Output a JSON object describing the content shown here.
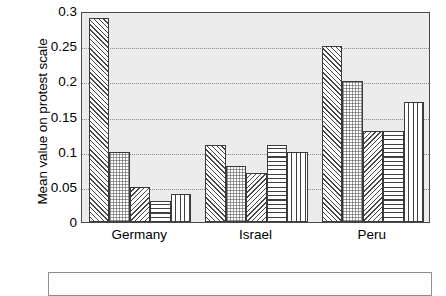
{
  "chart_data": {
    "type": "bar",
    "title": "",
    "xlabel": "",
    "ylabel": "Mean value on protest scale",
    "categories": [
      "Germany",
      "Israel",
      "Peru"
    ],
    "ylim": [
      0,
      0.3
    ],
    "yticks": [
      0,
      0.05,
      0.1,
      0.15,
      0.2,
      0.25,
      0.3
    ],
    "ytick_labels": [
      "0",
      "0.05",
      "0.1",
      "0.15",
      "0.2",
      "0.25",
      "0.3"
    ],
    "grid": true,
    "legend_position": "below-plot",
    "legend_entries": [],
    "series": [
      {
        "name": "series-1",
        "pattern": "diagonal-forward-hatch",
        "values": [
          0.29,
          0.11,
          0.25
        ]
      },
      {
        "name": "series-2",
        "pattern": "fine-dotted",
        "values": [
          0.1,
          0.08,
          0.2
        ]
      },
      {
        "name": "series-3",
        "pattern": "diagonal-backward-hatch",
        "values": [
          0.05,
          0.07,
          0.13
        ]
      },
      {
        "name": "series-4",
        "pattern": "horizontal-lines",
        "values": [
          0.03,
          0.11,
          0.13
        ]
      },
      {
        "name": "series-5",
        "pattern": "vertical-lines",
        "values": [
          0.04,
          0.1,
          0.17
        ]
      }
    ],
    "colors": {
      "plot_background": "#ececec",
      "bar_fill": "#ffffff",
      "bar_edge": "#3a3a3a",
      "gridline": "#8a8a8a",
      "axis": "#4a4a4a",
      "text": "#000000"
    }
  }
}
